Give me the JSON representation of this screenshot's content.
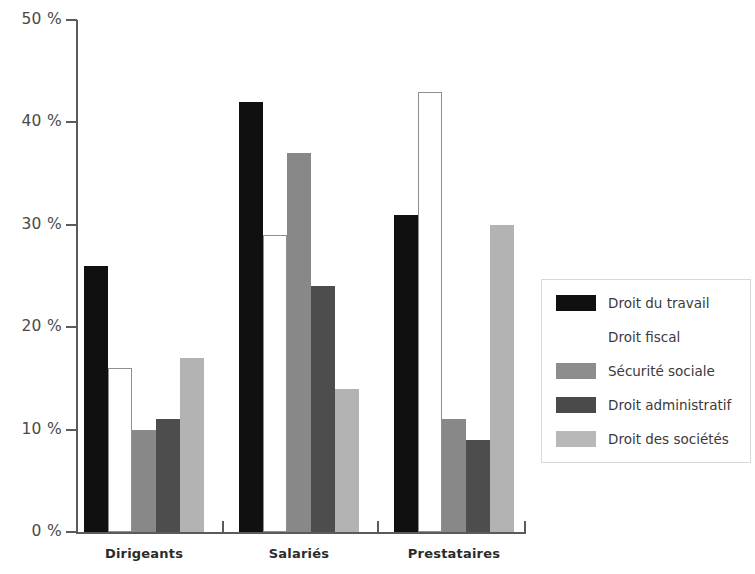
{
  "chart_data": {
    "type": "bar",
    "title": "",
    "subtitle": "",
    "xlabel": "",
    "ylabel": "",
    "ylim": [
      0,
      50
    ],
    "ytick_values": [
      50,
      40,
      30,
      20,
      10,
      0
    ],
    "ytick_labels": [
      "50 %",
      "40 %",
      "30 %",
      "20 %",
      "10 %",
      "0 %"
    ],
    "grid": false,
    "legend_position": "right",
    "categories": [
      "Dirigeants",
      "Salariés",
      "Prestataires"
    ],
    "series": [
      {
        "name": "Droit du travail",
        "swatch": "s0",
        "color": "#101010",
        "values": [
          26,
          42,
          31
        ]
      },
      {
        "name": "Droit fiscal",
        "swatch": "s1",
        "color": "#ffffff",
        "values": [
          16,
          29,
          43
        ]
      },
      {
        "name": "Sécurité sociale",
        "swatch": "s2",
        "color": "#888888",
        "values": [
          10,
          37,
          11
        ]
      },
      {
        "name": "Droit administratif",
        "swatch": "s3",
        "color": "#4d4d4d",
        "values": [
          11,
          24,
          9
        ]
      },
      {
        "name": "Droit des sociétés",
        "swatch": "s4",
        "color": "#b3b3b3",
        "values": [
          17,
          14,
          30
        ]
      }
    ]
  }
}
